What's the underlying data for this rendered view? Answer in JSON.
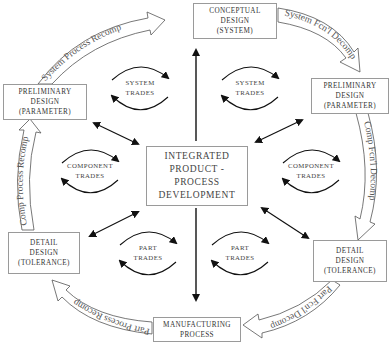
{
  "diagram": {
    "center": {
      "lines": [
        "INTEGRATED",
        "PRODUCT -",
        "PROCESS",
        "DEVELOPMENT"
      ]
    },
    "nodes": [
      {
        "id": "conceptual",
        "lines": [
          "CONCEPTUAL",
          "DESIGN",
          "(SYSTEM)"
        ]
      },
      {
        "id": "prelim-right",
        "lines": [
          "PRELIMINARY",
          "DESIGN",
          "(PARAMETER)"
        ]
      },
      {
        "id": "detail-right",
        "lines": [
          "DETAIL",
          "DESIGN",
          "(TOLERANCE)"
        ]
      },
      {
        "id": "manufacturing",
        "lines": [
          "MANUFACTURING",
          "PROCESS"
        ]
      },
      {
        "id": "detail-left",
        "lines": [
          "DETAIL",
          "DESIGN",
          "(TOLERANCE)"
        ]
      },
      {
        "id": "prelim-left",
        "lines": [
          "PRELIMINARY",
          "DESIGN",
          "(PARAMETER)"
        ]
      }
    ],
    "flow_arrows": [
      {
        "id": "system-fcnl-decomp",
        "label": "System Fcn'l Decomp"
      },
      {
        "id": "comp-fcnl-decomp",
        "label": "Comp Fcn'l Decomp"
      },
      {
        "id": "part-fcnl-decomp",
        "label": "Part Fcn'l Decomp"
      },
      {
        "id": "part-process-recomp",
        "label": "Part Process Recomp"
      },
      {
        "id": "comp-process-recomp",
        "label": "Comp Process Recomp"
      },
      {
        "id": "system-process-recomp",
        "label": "System Process Recomp"
      }
    ],
    "trades": [
      {
        "id": "system-left",
        "lines": [
          "SYSTEM",
          "TRADES"
        ]
      },
      {
        "id": "system-right",
        "lines": [
          "SYSTEM",
          "TRADES"
        ]
      },
      {
        "id": "component-left",
        "lines": [
          "COMPONENT",
          "TRADES"
        ]
      },
      {
        "id": "component-right",
        "lines": [
          "COMPONENT",
          "TRADES"
        ]
      },
      {
        "id": "part-left",
        "lines": [
          "PART",
          "TRADES"
        ]
      },
      {
        "id": "part-right",
        "lines": [
          "PART",
          "TRADES"
        ]
      }
    ],
    "colors": {
      "box_border": "#9a9a9a",
      "arrow_stroke": "#555555",
      "connector": "#111111",
      "text": "#333333"
    }
  }
}
